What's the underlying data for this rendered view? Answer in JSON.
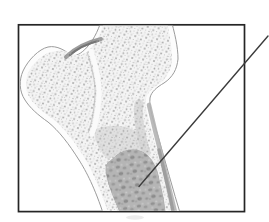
{
  "figure": {
    "frame": {
      "x": 18.5,
      "y": 24.8,
      "width": 226,
      "height": 186.8,
      "border_color": "#252525",
      "fill": "#ffffff"
    },
    "leader_line": {
      "x1": 268,
      "y1": 36,
      "x2": 139,
      "y2": 186.5,
      "color": "#3c3c3c"
    },
    "bone": {
      "outline_color": "#9b9b9b",
      "fill": "#fcfcfc",
      "trabecular_base": "#f4f4f4",
      "stipple_dot": "#ababab",
      "marrow_base": "#b5b5b5",
      "marrow_blotch": "#8f8f8f",
      "notch_shade": "#8c8c8c",
      "cortex_shade": "#b3b3b3"
    }
  }
}
